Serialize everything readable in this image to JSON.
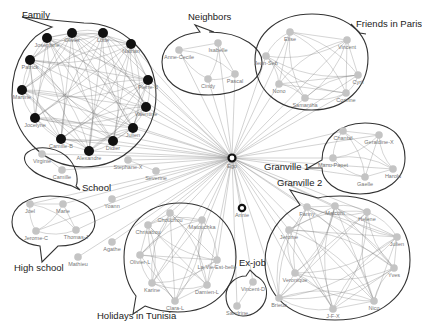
{
  "diagram": {
    "type": "ego-network",
    "ego": {
      "label": "Ego",
      "x": 232,
      "y": 158
    },
    "groups": [
      {
        "name": "Family",
        "label_x": 22,
        "label_y": 18,
        "style": "black",
        "cx": 84,
        "cy": 95,
        "rx": 72,
        "ry": 72,
        "nodes": [
          {
            "label": "Josephine",
            "x": 47,
            "y": 38
          },
          {
            "label": "Olivier",
            "x": 72,
            "y": 33
          },
          {
            "label": "Lotte",
            "x": 103,
            "y": 33
          },
          {
            "label": "Nathan",
            "x": 131,
            "y": 44
          },
          {
            "label": "Pierre-B",
            "x": 148,
            "y": 80
          },
          {
            "label": "Valentine",
            "x": 146,
            "y": 107
          },
          {
            "label": "Julien",
            "x": 133,
            "y": 128
          },
          {
            "label": "Didier",
            "x": 113,
            "y": 141
          },
          {
            "label": "Alexandre",
            "x": 89,
            "y": 151
          },
          {
            "label": "Camille-B",
            "x": 61,
            "y": 139
          },
          {
            "label": "Jocelyne",
            "x": 35,
            "y": 118
          },
          {
            "label": "Martine",
            "x": 22,
            "y": 90
          },
          {
            "label": "Patrick",
            "x": 30,
            "y": 60
          }
        ]
      },
      {
        "name": "Neighbors",
        "label_x": 188,
        "label_y": 20,
        "style": "gray",
        "nodes": [
          {
            "label": "Anne-Cecile",
            "x": 179,
            "y": 50
          },
          {
            "label": "Isabelle",
            "x": 218,
            "y": 43
          },
          {
            "label": "Cindy",
            "x": 208,
            "y": 79
          },
          {
            "label": "Pascal",
            "x": 235,
            "y": 74
          }
        ]
      },
      {
        "name": "Friends in Paris",
        "label_x": 356,
        "label_y": 27,
        "style": "gray",
        "nodes": [
          {
            "label": "Elise",
            "x": 290,
            "y": 32
          },
          {
            "label": "Vincent",
            "x": 347,
            "y": 40
          },
          {
            "label": "Jean-Seb",
            "x": 266,
            "y": 56
          },
          {
            "label": "Cyril",
            "x": 358,
            "y": 75
          },
          {
            "label": "Nono",
            "x": 279,
            "y": 84
          },
          {
            "label": "Samantha",
            "x": 305,
            "y": 98
          },
          {
            "label": "Corinne",
            "x": 346,
            "y": 93
          }
        ]
      },
      {
        "name": "Granville 1",
        "label_x": 264,
        "label_y": 170,
        "style": "gray",
        "nodes": [
          {
            "label": "Chantal",
            "x": 343,
            "y": 131
          },
          {
            "label": "Geraldine-X",
            "x": 379,
            "y": 135
          },
          {
            "label": "Manu-Papet",
            "x": 333,
            "y": 158
          },
          {
            "label": "Gaelle",
            "x": 365,
            "y": 177
          },
          {
            "label": "Harold",
            "x": 393,
            "y": 169
          }
        ]
      },
      {
        "name": "Granville 2",
        "label_x": 277,
        "label_y": 186,
        "style": "gray",
        "nodes": [
          {
            "label": "Fanny",
            "x": 307,
            "y": 207
          },
          {
            "label": "Malcom",
            "x": 335,
            "y": 206
          },
          {
            "label": "Helene",
            "x": 367,
            "y": 212
          },
          {
            "label": "Jerome",
            "x": 289,
            "y": 230
          },
          {
            "label": "Julien",
            "x": 397,
            "y": 237
          },
          {
            "label": "Veronique",
            "x": 295,
            "y": 273
          },
          {
            "label": "Nico",
            "x": 374,
            "y": 301
          },
          {
            "label": "J-F-X",
            "x": 333,
            "y": 309
          },
          {
            "label": "Brieuc",
            "x": 279,
            "y": 298
          },
          {
            "label": "Yves",
            "x": 394,
            "y": 268
          }
        ]
      },
      {
        "name": "School",
        "label_x": 82,
        "label_y": 191,
        "style": "gray",
        "nodes": [
          {
            "label": "Virginie",
            "x": 42,
            "y": 154
          },
          {
            "label": "Camille",
            "x": 62,
            "y": 170
          }
        ]
      },
      {
        "name": "High school",
        "label_x": 14,
        "label_y": 271,
        "style": "gray",
        "nodes": [
          {
            "label": "Joel",
            "x": 30,
            "y": 204
          },
          {
            "label": "Marie",
            "x": 63,
            "y": 204
          },
          {
            "label": "Jerome-C",
            "x": 36,
            "y": 231
          },
          {
            "label": "Thomas-J",
            "x": 76,
            "y": 230
          }
        ]
      },
      {
        "name": "Holidays in Tunisia",
        "label_x": 97,
        "label_y": 319,
        "style": "gray",
        "nodes": [
          {
            "label": "Chouchou",
            "x": 170,
            "y": 213
          },
          {
            "label": "Chrisabou",
            "x": 148,
            "y": 225
          },
          {
            "label": "Matouchka",
            "x": 202,
            "y": 220
          },
          {
            "label": "Olivier-L",
            "x": 140,
            "y": 255
          },
          {
            "label": "La-Vie-Est-belle",
            "x": 217,
            "y": 260
          },
          {
            "label": "Karine",
            "x": 152,
            "y": 283
          },
          {
            "label": "Damien-L",
            "x": 207,
            "y": 285
          },
          {
            "label": "Clara-L",
            "x": 175,
            "y": 301
          }
        ]
      },
      {
        "name": "Ex-job",
        "label_x": 239,
        "label_y": 266,
        "style": "gray",
        "nodes": [
          {
            "label": "Vincent-D",
            "x": 253,
            "y": 282
          },
          {
            "label": "Sandrine",
            "x": 237,
            "y": 306
          }
        ]
      }
    ],
    "isolates": [
      {
        "label": "Stephane-X",
        "x": 128,
        "y": 160
      },
      {
        "label": "Severine",
        "x": 156,
        "y": 171
      },
      {
        "label": "Yoann",
        "x": 112,
        "y": 199
      },
      {
        "label": "Agathe",
        "x": 112,
        "y": 242
      },
      {
        "label": "Mathieu",
        "x": 78,
        "y": 257
      },
      {
        "label": "Annie",
        "x": 242,
        "y": 208,
        "style": "ring"
      }
    ]
  }
}
